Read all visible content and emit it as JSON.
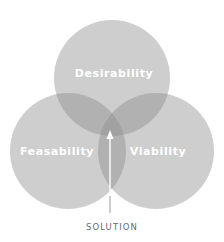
{
  "diagram": {
    "type": "venn",
    "circles": [
      {
        "id": "desirability",
        "label": "Desirability",
        "cx": 112,
        "cy": 78,
        "r": 58
      },
      {
        "id": "feasability",
        "label": "Feasability",
        "cx": 68,
        "cy": 151,
        "r": 58
      },
      {
        "id": "viability",
        "label": "Viability",
        "cx": 156,
        "cy": 151,
        "r": 58
      }
    ],
    "fill_color": "#8a8a8a",
    "fill_opacity": 0.42,
    "label_color": "#ffffff",
    "annotation": {
      "label": "SOLUTION",
      "arrow_color": "#ffffff",
      "text_color": "#6b6b6b"
    }
  }
}
